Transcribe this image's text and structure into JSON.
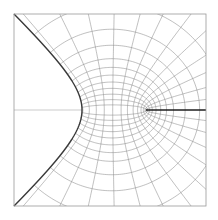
{
  "figure": {
    "type": "conformal-grid-diagram",
    "frame": {
      "x": 14,
      "y": 14,
      "width": 192,
      "height": 192
    },
    "axis_y": 110,
    "boundary_vertex": {
      "x": 82,
      "y": 110
    },
    "slit": {
      "x1": 146,
      "x2": 206,
      "y": 110
    },
    "colors": {
      "grid": "#8c8c8c",
      "frame": "#9a9a9a",
      "boundary": "#3a3a3a",
      "slit": "#1e1e1e",
      "axis": "#b5b5b5",
      "background": "#ffffff"
    },
    "grid": {
      "focus_x": 146,
      "scale": 34,
      "u_levels": [
        0.15,
        0.3,
        0.45,
        0.6,
        0.75,
        0.9,
        1.05,
        1.2,
        1.4,
        1.6,
        1.85,
        2.1
      ],
      "v_levels": [
        0.12,
        0.25,
        0.4,
        0.55,
        0.72,
        0.9,
        1.1,
        1.3,
        1.55,
        1.8,
        2.05,
        2.3,
        2.6,
        2.9
      ]
    }
  }
}
